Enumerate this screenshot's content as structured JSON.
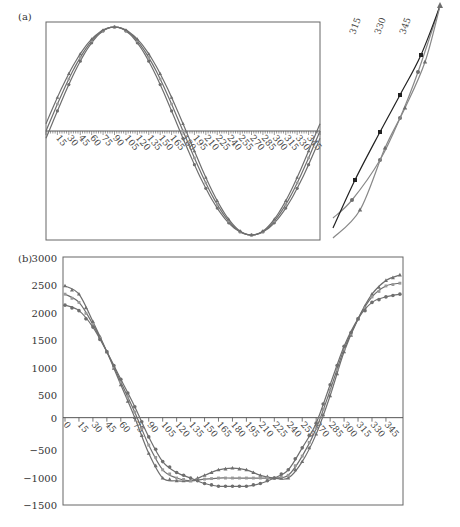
{
  "chart_data": [
    {
      "panel": "(a)",
      "type": "line",
      "title": "",
      "xlabel": "",
      "ylabel": "",
      "grid": false,
      "legend": null,
      "x": [
        0,
        15,
        30,
        45,
        60,
        75,
        90,
        105,
        120,
        135,
        150,
        165,
        180,
        195,
        210,
        225,
        240,
        255,
        270,
        285,
        300,
        315,
        330,
        345,
        360
      ],
      "x_tick_labels": [
        "15",
        "30",
        "45",
        "60",
        "75",
        "90",
        "105",
        "120",
        "135",
        "150",
        "165",
        "180",
        "195",
        "210",
        "225",
        "240",
        "255",
        "270",
        "285",
        "300",
        "315",
        "330",
        "345"
      ],
      "ylim": [
        -1,
        1
      ],
      "y_note": "no y-axis labels shown; values are normalized estimates",
      "series": [
        {
          "name": "series-circle",
          "marker": "circle",
          "phase_shift": -4
        },
        {
          "name": "series-square",
          "marker": "square",
          "phase_shift": 0
        },
        {
          "name": "series-triangle",
          "marker": "triangle",
          "phase_shift": 4
        }
      ],
      "inset": {
        "description": "zoomed view of curves near 315–360",
        "x_tick_labels": [
          "315",
          "330",
          "345"
        ]
      }
    },
    {
      "panel": "(b)",
      "type": "line",
      "title": "",
      "xlabel": "",
      "ylabel": "",
      "grid": false,
      "legend": null,
      "ylim": [
        -1500,
        3000
      ],
      "y_ticks": [
        3000,
        2500,
        2000,
        1500,
        1000,
        500,
        0,
        -500,
        -1000,
        -1500
      ],
      "x_tick_labels": [
        "0",
        "15",
        "30",
        "45",
        "60",
        "75",
        "90",
        "105",
        "120",
        "135",
        "150",
        "165",
        "180",
        "195",
        "210",
        "225",
        "240",
        "255",
        "270",
        "285",
        "300",
        "315",
        "330",
        "345"
      ],
      "x": [
        0,
        15,
        30,
        45,
        60,
        75,
        90,
        105,
        120,
        135,
        150,
        165,
        180,
        195,
        210,
        225,
        240,
        255,
        270,
        285,
        300,
        315,
        330,
        345,
        360
      ],
      "series": [
        {
          "name": "series-triangle",
          "marker": "triangle",
          "values": [
            2400,
            2250,
            1750,
            1200,
            600,
            0,
            -650,
            -1100,
            -1150,
            -1150,
            -1050,
            -950,
            -920,
            -950,
            -1050,
            -1100,
            -1100,
            -800,
            -300,
            400,
            1200,
            1800,
            2250,
            2500,
            2600
          ]
        },
        {
          "name": "series-square",
          "marker": "square",
          "values": [
            2250,
            2100,
            1700,
            1200,
            650,
            100,
            -500,
            -950,
            -1100,
            -1150,
            -1120,
            -1100,
            -1100,
            -1100,
            -1100,
            -1100,
            -1050,
            -700,
            -200,
            500,
            1250,
            1800,
            2200,
            2400,
            2450
          ]
        },
        {
          "name": "series-circle",
          "marker": "circle",
          "values": [
            2050,
            1950,
            1650,
            1200,
            700,
            200,
            -350,
            -800,
            -1000,
            -1100,
            -1200,
            -1250,
            -1250,
            -1250,
            -1200,
            -1100,
            -950,
            -550,
            -100,
            600,
            1300,
            1800,
            2100,
            2200,
            2250
          ]
        }
      ]
    }
  ],
  "labels": {
    "panel_a": "(a)",
    "panel_b": "(b)"
  },
  "colors": {
    "line": "#6e6e6e",
    "axis": "#555555"
  }
}
